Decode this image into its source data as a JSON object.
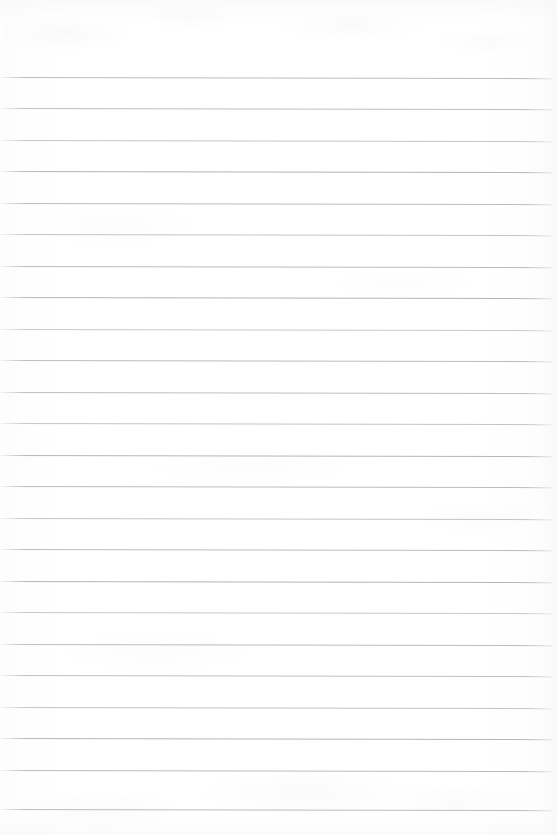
{
  "document": {
    "kind": "scanned-blank-ruled-paper",
    "page_width": 557,
    "page_height": 835,
    "background_color": "#ffffff",
    "paper_tone": "#fdfdfd",
    "visible_text": "",
    "notes_text": "",
    "heading_text": "",
    "page_number_text": ""
  },
  "ruling": {
    "line_color": "#b9bcc1",
    "line_thickness_px": 1,
    "line_count": 24,
    "first_line_y": 77,
    "line_spacing_px": 31.4,
    "line_left_x": 0,
    "line_right_x": 552,
    "slant_degrees": 0.12,
    "lines": [
      {
        "index": 1,
        "y": 77,
        "x1": 0,
        "x2": 552,
        "tone": "#b9bcc1"
      },
      {
        "index": 2,
        "y": 108,
        "x1": 0,
        "x2": 552,
        "tone": "#bcbfc4"
      },
      {
        "index": 3,
        "y": 140,
        "x1": 0,
        "x2": 552,
        "tone": "#c2c5c9"
      },
      {
        "index": 4,
        "y": 171,
        "x1": 0,
        "x2": 552,
        "tone": "#b3b7bc"
      },
      {
        "index": 5,
        "y": 203,
        "x1": 0,
        "x2": 552,
        "tone": "#b9bcc1"
      },
      {
        "index": 6,
        "y": 234,
        "x1": 0,
        "x2": 552,
        "tone": "#c2c5c9"
      },
      {
        "index": 7,
        "y": 266,
        "x1": 0,
        "x2": 552,
        "tone": "#b9bcc1"
      },
      {
        "index": 8,
        "y": 297,
        "x1": 0,
        "x2": 552,
        "tone": "#b3b7bc"
      },
      {
        "index": 9,
        "y": 329,
        "x1": 0,
        "x2": 552,
        "tone": "#c6c9cd"
      },
      {
        "index": 10,
        "y": 360,
        "x1": 0,
        "x2": 552,
        "tone": "#b9bcc1"
      },
      {
        "index": 11,
        "y": 392,
        "x1": 0,
        "x2": 552,
        "tone": "#bcbfc4"
      },
      {
        "index": 12,
        "y": 423,
        "x1": 0,
        "x2": 552,
        "tone": "#c2c5c9"
      },
      {
        "index": 13,
        "y": 455,
        "x1": 0,
        "x2": 552,
        "tone": "#b3b7bc"
      },
      {
        "index": 14,
        "y": 486,
        "x1": 0,
        "x2": 552,
        "tone": "#b9bcc1"
      },
      {
        "index": 15,
        "y": 518,
        "x1": 0,
        "x2": 552,
        "tone": "#c2c5c9"
      },
      {
        "index": 16,
        "y": 549,
        "x1": 0,
        "x2": 552,
        "tone": "#b9bcc1"
      },
      {
        "index": 17,
        "y": 581,
        "x1": 0,
        "x2": 552,
        "tone": "#b3b7bc"
      },
      {
        "index": 18,
        "y": 612,
        "x1": 0,
        "x2": 552,
        "tone": "#c6c9cd"
      },
      {
        "index": 19,
        "y": 644,
        "x1": 0,
        "x2": 552,
        "tone": "#b9bcc1"
      },
      {
        "index": 20,
        "y": 675,
        "x1": 0,
        "x2": 552,
        "tone": "#bcbfc4"
      },
      {
        "index": 21,
        "y": 707,
        "x1": 0,
        "x2": 552,
        "tone": "#c2c5c9"
      },
      {
        "index": 22,
        "y": 738,
        "x1": 0,
        "x2": 552,
        "tone": "#b3b7bc"
      },
      {
        "index": 23,
        "y": 770,
        "x1": 0,
        "x2": 552,
        "tone": "#b9bcc1"
      },
      {
        "index": 24,
        "y": 809,
        "x1": 0,
        "x2": 552,
        "tone": "#b9bcc1"
      }
    ]
  },
  "margins": {
    "top_margin_px": 77,
    "bottom_margin_px": 26,
    "left_gutter_px": 9,
    "right_margin_px": 5
  }
}
